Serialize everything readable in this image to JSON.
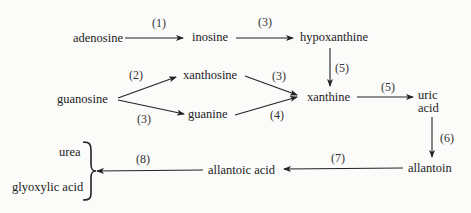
{
  "diagram": {
    "type": "metabolic pathway",
    "nodes": {
      "adenosine": "adenosine",
      "inosine": "inosine",
      "hypoxanthine": "hypoxanthine",
      "guanosine": "guanosine",
      "xanthosine": "xanthosine",
      "guanine": "guanine",
      "xanthine": "xanthine",
      "uric_acid_line1": "uric",
      "uric_acid_line2": "acid",
      "allantoin": "allantoin",
      "allantoic_acid": "allantoic acid",
      "urea": "urea",
      "glyoxylic_acid": "glyoxylic acid"
    },
    "steps": {
      "adenosine_inosine": "(1)",
      "inosine_hypoxanthine": "(3)",
      "guanosine_xanthosine": "(2)",
      "guanosine_guanine": "(3)",
      "xanthosine_xanthine": "(3)",
      "guanine_xanthine": "(4)",
      "hypoxanthine_xanthine": "(5)",
      "xanthine_uric": "(5)",
      "uric_allantoin": "(6)",
      "allantoin_allantoic": "(7)",
      "allantoic_products": "(8)"
    },
    "edges": [
      {
        "from": "adenosine",
        "to": "inosine",
        "step": "(1)"
      },
      {
        "from": "inosine",
        "to": "hypoxanthine",
        "step": "(3)"
      },
      {
        "from": "guanosine",
        "to": "xanthosine",
        "step": "(2)"
      },
      {
        "from": "guanosine",
        "to": "guanine",
        "step": "(3)"
      },
      {
        "from": "xanthosine",
        "to": "xanthine",
        "step": "(3)"
      },
      {
        "from": "guanine",
        "to": "xanthine",
        "step": "(4)"
      },
      {
        "from": "hypoxanthine",
        "to": "xanthine",
        "step": "(5)"
      },
      {
        "from": "xanthine",
        "to": "uric acid",
        "step": "(5)"
      },
      {
        "from": "uric acid",
        "to": "allantoin",
        "step": "(6)"
      },
      {
        "from": "allantoin",
        "to": "allantoic acid",
        "step": "(7)"
      },
      {
        "from": "allantoic acid",
        "to": "urea + glyoxylic acid",
        "step": "(8)"
      }
    ],
    "colors": {
      "ink": "#222222",
      "background": "#fbfbfa"
    }
  }
}
